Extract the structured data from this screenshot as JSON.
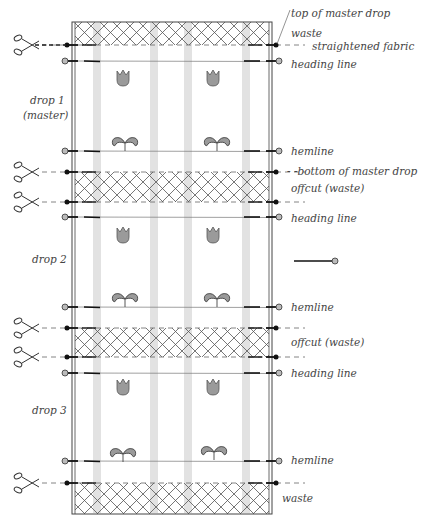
{
  "fabric": {
    "x": 72,
    "y": 22,
    "width": 200,
    "height": 492,
    "stripes_x": [
      93,
      150,
      184,
      242
    ],
    "stripe_width": 8,
    "colors": {
      "outline": "#444444",
      "stripe": "#e2e2e2",
      "hatch": "#555555",
      "motif": "#9a9a9a",
      "pin_head": "#bbbbbb"
    }
  },
  "waste_zones": [
    {
      "name": "top-waste",
      "y1": 22,
      "y2": 45
    },
    {
      "name": "offcut-1",
      "y1": 172,
      "y2": 202
    },
    {
      "name": "offcut-2",
      "y1": 328,
      "y2": 357
    },
    {
      "name": "bottom-waste",
      "y1": 483,
      "y2": 514
    }
  ],
  "cut_lines": [
    45,
    172,
    202,
    328,
    357,
    483
  ],
  "marked_lines": [
    {
      "type": "heading",
      "y": 61
    },
    {
      "type": "hem",
      "y": 151
    },
    {
      "type": "heading",
      "y": 217
    },
    {
      "type": "hem",
      "y": 307
    },
    {
      "type": "heading",
      "y": 373
    },
    {
      "type": "hem",
      "y": 461
    }
  ],
  "motifs": {
    "tulips": [
      {
        "x": 123,
        "y": 77
      },
      {
        "x": 213,
        "y": 77
      },
      {
        "x": 123,
        "y": 234
      },
      {
        "x": 213,
        "y": 234
      },
      {
        "x": 123,
        "y": 386
      },
      {
        "x": 213,
        "y": 386
      }
    ],
    "sprouts": [
      {
        "x": 125,
        "y": 142
      },
      {
        "x": 217,
        "y": 142
      },
      {
        "x": 125,
        "y": 298
      },
      {
        "x": 217,
        "y": 298
      },
      {
        "x": 123,
        "y": 453
      },
      {
        "x": 214,
        "y": 451
      }
    ]
  },
  "loose_pin": {
    "x1": 294,
    "y1": 261,
    "x2": 333,
    "y2": 261
  },
  "labels": {
    "right": [
      {
        "text": "top of master drop",
        "x": 291,
        "y": 8
      },
      {
        "text": "waste",
        "x": 291,
        "y": 28
      },
      {
        "text": "straightened fabric",
        "x": 312,
        "y": 41
      },
      {
        "text": "heading line",
        "x": 291,
        "y": 59
      },
      {
        "text": "hemline",
        "x": 291,
        "y": 146
      },
      {
        "text": "- -bottom of master drop",
        "x": 287,
        "y": 166
      },
      {
        "text": "offcut (waste)",
        "x": 291,
        "y": 183
      },
      {
        "text": "heading line",
        "x": 291,
        "y": 213
      },
      {
        "text": "hemline",
        "x": 291,
        "y": 302
      },
      {
        "text": "offcut (waste)",
        "x": 291,
        "y": 337
      },
      {
        "text": "heading line",
        "x": 291,
        "y": 368
      },
      {
        "text": "hemline",
        "x": 291,
        "y": 455
      },
      {
        "text": "waste",
        "x": 282,
        "y": 493
      }
    ],
    "left": [
      {
        "text": "drop 1",
        "x": 30,
        "y": 95
      },
      {
        "text": "(master)",
        "x": 23,
        "y": 110
      },
      {
        "text": "drop 2",
        "x": 32,
        "y": 254
      },
      {
        "text": "drop 3",
        "x": 32,
        "y": 405
      }
    ]
  },
  "scissors_y": [
    45,
    172,
    202,
    328,
    357,
    483
  ]
}
